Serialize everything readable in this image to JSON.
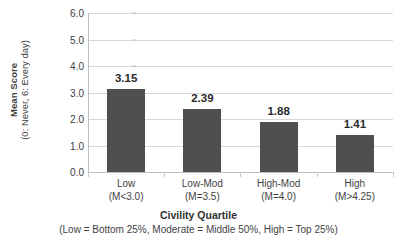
{
  "chart_data": {
    "type": "bar",
    "title": "",
    "categories": [
      "Low",
      "Low-Mod",
      "High-Mod",
      "High"
    ],
    "category_sublabels": [
      "(M<3.0)",
      "(M=3.5)",
      "(M=4.0)",
      "(M>4.25)"
    ],
    "values": [
      3.15,
      2.39,
      1.88,
      1.41
    ],
    "value_labels": [
      "3.15",
      "2.39",
      "1.88",
      "1.41"
    ],
    "xlabel": "Civility Quartile",
    "xlabel_note": "(Low = Bottom 25%, Moderate = Middle 50%, High = Top 25%)",
    "ylabel": "Mean Score",
    "ylabel_note": "(0: Never, 6: Every day)",
    "ylim": [
      0,
      6
    ],
    "ytick_step": 1,
    "ytick_labels": [
      "0.0",
      "1.0",
      "2.0",
      "3.0",
      "4.0",
      "5.0",
      "6.0"
    ],
    "grid": true,
    "legend": false,
    "bar_color": "#4f4f4f",
    "gridline_color": "#d9d9d9",
    "axis_color": "#bfbfbf",
    "background_color": "#ffffff"
  },
  "axis": {
    "y_title_main": "Mean Score",
    "y_title_sub": "(0: Never, 6: Every day)",
    "x_title_main": "Civility Quartile",
    "x_title_sub": "(Low = Bottom 25%, Moderate = Middle 50%, High = Top 25%)"
  }
}
